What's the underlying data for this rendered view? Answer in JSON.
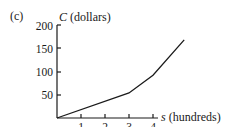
{
  "panel_label": "(c)",
  "chart_data": {
    "type": "line",
    "title": "",
    "xlabel": "s (hundreds)",
    "ylabel": "C (dollars)",
    "xlabel_var": "s",
    "xlabel_unit": "(hundreds)",
    "ylabel_var": "C",
    "ylabel_unit": "(dollars)",
    "x_ticks": [
      "1",
      "2",
      "3",
      "4"
    ],
    "y_ticks": [
      "50",
      "100",
      "150",
      "200"
    ],
    "xlim": [
      0,
      5.5
    ],
    "ylim": [
      0,
      200
    ],
    "grid": false,
    "legend": "none",
    "series": [
      {
        "name": "C(s)",
        "x": [
          0,
          3,
          4,
          5.3
        ],
        "y": [
          0,
          54,
          92,
          168
        ]
      }
    ],
    "color": "#1a1a1a"
  }
}
